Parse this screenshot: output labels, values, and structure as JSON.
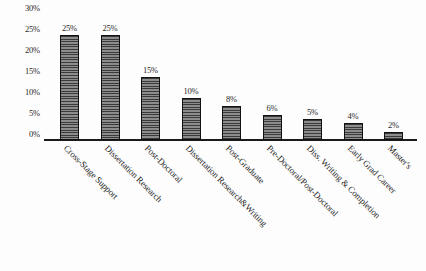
{
  "chart_data": {
    "type": "bar",
    "title": "",
    "xlabel": "",
    "ylabel": "",
    "ylim": [
      0,
      30
    ],
    "grid": false,
    "legend": null,
    "y_ticks": [
      "0%",
      "5%",
      "10%",
      "15%",
      "20%",
      "25%",
      "30%"
    ],
    "y_tick_values": [
      0,
      5,
      10,
      15,
      20,
      25,
      30
    ],
    "categories": [
      "Cross-Stage Support",
      "Dissertation Research",
      "Post-Doctoral",
      "Dissertation Research&Writing",
      "Post-Graduate",
      "Pre-Doctoral/Post-Doctoral",
      "Diss. Writing & Completion",
      "Early Grad Career",
      "Master's"
    ],
    "values": [
      25,
      25,
      15,
      10,
      8,
      6,
      5,
      4,
      2
    ],
    "value_labels": [
      "25%",
      "25%",
      "15%",
      "10%",
      "8%",
      "6%",
      "5%",
      "4%",
      "2%"
    ],
    "bar_color": "#6b6b6b",
    "bar_edge_color": "#121212",
    "axis_color": "#1a1a1a",
    "background_color": "#fdfdfd"
  }
}
